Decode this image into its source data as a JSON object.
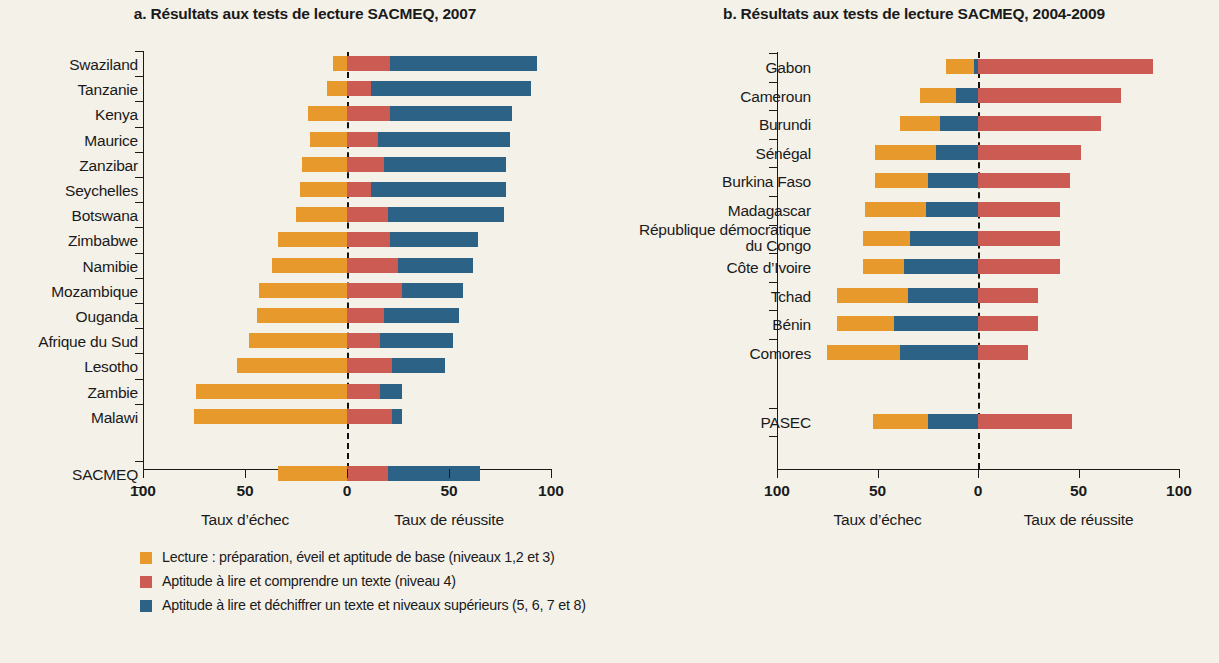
{
  "colors": {
    "background": "#F4F1E9",
    "orange": "#E8992B",
    "red": "#CC5B54",
    "blue": "#2B6286",
    "axis": "#1a1a1a"
  },
  "panel_a": {
    "title": "a. Résultats aux tests de lecture SACMEQ, 2007",
    "axis": {
      "ticks": [
        "100",
        "50",
        "0",
        "50",
        "100"
      ],
      "caption_left": "Taux d’échec",
      "caption_right": "Taux de réussite"
    },
    "legend": [
      {
        "color": "#E8992B",
        "text": "Lecture : préparation, éveil et aptitude de base (niveaux 1,2 et 3)"
      },
      {
        "color": "#CC5B54",
        "text": "Aptitude à lire et comprendre un texte (niveau 4)"
      },
      {
        "color": "#2B6286",
        "text": "Aptitude à lire et déchiffrer un texte et niveaux supérieurs (5, 6, 7 et 8)"
      }
    ]
  },
  "panel_b": {
    "title": "b. Résultats aux tests de lecture SACMEQ, 2004-2009",
    "axis": {
      "ticks": [
        "100",
        "50",
        "0",
        "50",
        "100"
      ],
      "caption_left": "Taux d’échec",
      "caption_right": "Taux de réussite"
    },
    "legend": [
      {
        "color": "#2B6286",
        "text": "Niveau 1 : Niveau égal ou inférieur à celui équivalant à deviner au hasard (score inférieur à 25 %)"
      },
      {
        "color": "#E8992B",
        "text": "Niveau 2 : Score compris entre 25 % et 40 %"
      },
      {
        "color": "#CC5B54",
        "text": "Niveau 3 : Niveau égal ou supérieur au niveau correspondant à la maîtrise des « compétences de base »"
      }
    ]
  },
  "chart_data": [
    {
      "type": "bar",
      "orientation": "horizontal-diverging-stacked",
      "title": "a. Résultats aux tests de lecture SACMEQ, 2007",
      "xlabel": "Taux d’échec / Taux de réussite",
      "ylabel": "",
      "xlim": [
        -100,
        100
      ],
      "xticks": [
        -100,
        -50,
        0,
        50,
        100
      ],
      "xticklabels": [
        "100",
        "50",
        "0",
        "50",
        "100"
      ],
      "grid": false,
      "legend_position": "bottom-left",
      "series": [
        {
          "name": "Lecture : préparation, éveil et aptitude de base (niveaux 1,2 et 3)",
          "color": "#E8992B",
          "side": "negative"
        },
        {
          "name": "Aptitude à lire et comprendre un texte (niveau 4)",
          "color": "#CC5B54",
          "side": "positive"
        },
        {
          "name": "Aptitude à lire et déchiffrer un texte et niveaux supérieurs (5, 6, 7 et 8)",
          "color": "#2B6286",
          "side": "positive"
        }
      ],
      "categories": [
        "Swaziland",
        "Tanzanie",
        "Kenya",
        "Maurice",
        "Zanzibar",
        "Seychelles",
        "Botswana",
        "Zimbabwe",
        "Namibie",
        "Mozambique",
        "Ouganda",
        "Afrique du Sud",
        "Lesotho",
        "Zambie",
        "Malawi",
        "SACMEQ"
      ],
      "rows": [
        {
          "category": "Swaziland",
          "failure": 7,
          "level4": 21,
          "level5plus": 72,
          "success_total": 93
        },
        {
          "category": "Tanzanie",
          "failure": 10,
          "level4": 12,
          "level5plus": 78,
          "success_total": 90
        },
        {
          "category": "Kenya",
          "failure": 19,
          "level4": 21,
          "level5plus": 60,
          "success_total": 81
        },
        {
          "category": "Maurice",
          "failure": 18,
          "level4": 15,
          "level5plus": 65,
          "success_total": 80
        },
        {
          "category": "Zanzibar",
          "failure": 22,
          "level4": 18,
          "level5plus": 60,
          "success_total": 78
        },
        {
          "category": "Seychelles",
          "failure": 23,
          "level4": 12,
          "level5plus": 66,
          "success_total": 78
        },
        {
          "category": "Botswana",
          "failure": 25,
          "level4": 20,
          "level5plus": 57,
          "success_total": 77
        },
        {
          "category": "Zimbabwe",
          "failure": 34,
          "level4": 21,
          "level5plus": 43,
          "success_total": 64
        },
        {
          "category": "Namibie",
          "failure": 37,
          "level4": 25,
          "level5plus": 37,
          "success_total": 62
        },
        {
          "category": "Mozambique",
          "failure": 43,
          "level4": 27,
          "level5plus": 30,
          "success_total": 57
        },
        {
          "category": "Ouganda",
          "failure": 44,
          "level4": 18,
          "level5plus": 37,
          "success_total": 55
        },
        {
          "category": "Afrique du Sud",
          "failure": 48,
          "level4": 16,
          "level5plus": 36,
          "success_total": 52
        },
        {
          "category": "Lesotho",
          "failure": 54,
          "level4": 22,
          "level5plus": 26,
          "success_total": 48
        },
        {
          "category": "Zambie",
          "failure": 74,
          "level4": 16,
          "level5plus": 11,
          "success_total": 27
        },
        {
          "category": "Malawi",
          "failure": 75,
          "level4": 22,
          "level5plus": 5,
          "success_total": 27
        },
        {
          "category": "SACMEQ",
          "failure": 34,
          "level4": 20,
          "level5plus": 45,
          "success_total": 65
        }
      ]
    },
    {
      "type": "bar",
      "orientation": "horizontal-diverging-stacked",
      "title": "b. Résultats aux tests de lecture SACMEQ, 2004-2009",
      "xlabel": "Taux d’échec / Taux de réussite",
      "ylabel": "",
      "xlim": [
        -100,
        100
      ],
      "xticks": [
        -100,
        -50,
        0,
        50,
        100
      ],
      "xticklabels": [
        "100",
        "50",
        "0",
        "50",
        "100"
      ],
      "grid": false,
      "legend_position": "bottom-right",
      "series": [
        {
          "name": "Niveau 2 : Score compris entre 25 % et 40 %",
          "color": "#E8992B",
          "side": "negative-outer"
        },
        {
          "name": "Niveau 1 : Niveau égal ou inférieur à celui équivalant à deviner au hasard (score inférieur à 25 %)",
          "color": "#2B6286",
          "side": "negative-inner"
        },
        {
          "name": "Niveau 3 : Niveau égal ou supérieur au niveau correspondant à la maîtrise des « compétences de base »",
          "color": "#CC5B54",
          "side": "positive"
        }
      ],
      "categories": [
        "Gabon",
        "Cameroun",
        "Burundi",
        "Sénégal",
        "Burkina Faso",
        "Madagascar",
        "République démocratique du Congo",
        "Côte d’Ivoire",
        "Tchad",
        "Bénin",
        "Comores",
        "PASEC"
      ],
      "rows": [
        {
          "category": "Gabon",
          "niveau2": 14,
          "niveau1": 2,
          "niveau3": 87,
          "failure_total": 16
        },
        {
          "category": "Cameroun",
          "niveau2": 18,
          "niveau1": 11,
          "niveau3": 71,
          "failure_total": 29
        },
        {
          "category": "Burundi",
          "niveau2": 20,
          "niveau1": 19,
          "niveau3": 61,
          "failure_total": 39
        },
        {
          "category": "Sénégal",
          "niveau2": 30,
          "niveau1": 21,
          "niveau3": 51,
          "failure_total": 51
        },
        {
          "category": "Burkina Faso",
          "niveau2": 26,
          "niveau1": 25,
          "niveau3": 46,
          "failure_total": 51
        },
        {
          "category": "Madagascar",
          "niveau2": 30,
          "niveau1": 26,
          "niveau3": 41,
          "failure_total": 56
        },
        {
          "category": "République démocratique du Congo",
          "niveau2": 23,
          "niveau1": 34,
          "niveau3": 41,
          "failure_total": 57
        },
        {
          "category": "Côte d’Ivoire",
          "niveau2": 20,
          "niveau1": 37,
          "niveau3": 41,
          "failure_total": 57
        },
        {
          "category": "Tchad",
          "niveau2": 35,
          "niveau1": 35,
          "niveau3": 30,
          "failure_total": 70
        },
        {
          "category": "Bénin",
          "niveau2": 28,
          "niveau1": 42,
          "niveau3": 30,
          "failure_total": 70
        },
        {
          "category": "Comores",
          "niveau2": 36,
          "niveau1": 39,
          "niveau3": 25,
          "failure_total": 75
        },
        {
          "category": "PASEC",
          "niveau2": 27,
          "niveau1": 25,
          "niveau3": 47,
          "failure_total": 52
        }
      ]
    }
  ]
}
